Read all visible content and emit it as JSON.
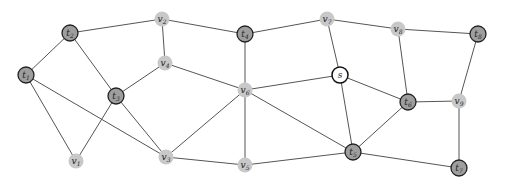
{
  "diagram": {
    "type": "graph",
    "colors": {
      "terminal_fill": "#9e9e9e",
      "terminal_stroke": "#222222",
      "steiner_fill": "#c8c8c8",
      "source_fill": "#ffffff",
      "source_stroke": "#111111",
      "edge": "#555555"
    },
    "nodes": [
      {
        "id": "t1",
        "base": "t",
        "sub": "1",
        "kind": "terminal",
        "x": 26,
        "y": 75
      },
      {
        "id": "t2",
        "base": "t",
        "sub": "2",
        "kind": "terminal",
        "x": 70,
        "y": 33
      },
      {
        "id": "t3",
        "base": "t",
        "sub": "3",
        "kind": "terminal",
        "x": 116,
        "y": 96
      },
      {
        "id": "t4",
        "base": "t",
        "sub": "4",
        "kind": "terminal",
        "x": 245,
        "y": 34
      },
      {
        "id": "t5",
        "base": "t",
        "sub": "5",
        "kind": "terminal",
        "x": 353,
        "y": 152
      },
      {
        "id": "t6",
        "base": "t",
        "sub": "6",
        "kind": "terminal",
        "x": 408,
        "y": 102
      },
      {
        "id": "t7",
        "base": "t",
        "sub": "7",
        "kind": "terminal",
        "x": 459,
        "y": 168
      },
      {
        "id": "t8",
        "base": "t",
        "sub": "8",
        "kind": "terminal",
        "x": 478,
        "y": 34
      },
      {
        "id": "v1",
        "base": "v",
        "sub": "1",
        "kind": "steiner",
        "x": 76,
        "y": 161
      },
      {
        "id": "v2",
        "base": "v",
        "sub": "2",
        "kind": "steiner",
        "x": 162,
        "y": 19
      },
      {
        "id": "v3",
        "base": "v",
        "sub": "3",
        "kind": "steiner",
        "x": 166,
        "y": 157
      },
      {
        "id": "v4",
        "base": "v",
        "sub": "4",
        "kind": "steiner",
        "x": 165,
        "y": 63
      },
      {
        "id": "v5",
        "base": "v",
        "sub": "5",
        "kind": "steiner",
        "x": 245,
        "y": 165
      },
      {
        "id": "v6",
        "base": "v",
        "sub": "6",
        "kind": "steiner",
        "x": 245,
        "y": 90
      },
      {
        "id": "v7",
        "base": "v",
        "sub": "7",
        "kind": "steiner",
        "x": 327,
        "y": 19
      },
      {
        "id": "v8",
        "base": "v",
        "sub": "8",
        "kind": "steiner",
        "x": 398,
        "y": 29
      },
      {
        "id": "v9",
        "base": "v",
        "sub": "9",
        "kind": "steiner",
        "x": 459,
        "y": 101
      },
      {
        "id": "s",
        "base": "s",
        "sub": "",
        "kind": "source",
        "x": 340,
        "y": 75
      }
    ],
    "edges": [
      [
        "t1",
        "t2"
      ],
      [
        "t1",
        "v1"
      ],
      [
        "t1",
        "v3"
      ],
      [
        "t2",
        "v2"
      ],
      [
        "t2",
        "t3"
      ],
      [
        "v2",
        "v4"
      ],
      [
        "v2",
        "t4"
      ],
      [
        "v4",
        "t3"
      ],
      [
        "v4",
        "v6"
      ],
      [
        "t3",
        "v1"
      ],
      [
        "t3",
        "v3"
      ],
      [
        "v3",
        "v6"
      ],
      [
        "v3",
        "v5"
      ],
      [
        "t4",
        "v6"
      ],
      [
        "t4",
        "v7"
      ],
      [
        "v6",
        "v5"
      ],
      [
        "v6",
        "s"
      ],
      [
        "v6",
        "t5"
      ],
      [
        "v5",
        "t5"
      ],
      [
        "v7",
        "v8"
      ],
      [
        "v7",
        "s"
      ],
      [
        "v8",
        "t8"
      ],
      [
        "v8",
        "t6"
      ],
      [
        "s",
        "t6"
      ],
      [
        "s",
        "t5"
      ],
      [
        "t6",
        "v9"
      ],
      [
        "t6",
        "t5"
      ],
      [
        "t8",
        "v9"
      ],
      [
        "v9",
        "t7"
      ],
      [
        "t5",
        "t7"
      ]
    ]
  }
}
